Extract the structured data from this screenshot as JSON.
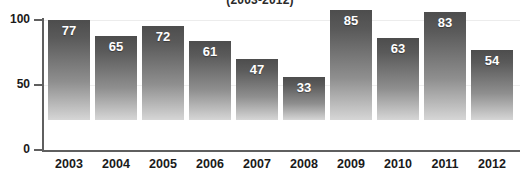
{
  "chart_data": {
    "type": "bar",
    "title": "(2003-2012)",
    "xlabel": "",
    "ylabel": "",
    "categories": [
      "2003",
      "2004",
      "2005",
      "2006",
      "2007",
      "2008",
      "2009",
      "2010",
      "2011",
      "2012"
    ],
    "values": [
      77,
      65,
      72,
      61,
      47,
      33,
      85,
      63,
      83,
      54
    ],
    "ylim": [
      0,
      100
    ],
    "ytick_labels": [
      "100",
      "50",
      "0"
    ],
    "ytick_values": [
      100,
      50,
      0
    ],
    "grid": true,
    "legend": null,
    "bar_color_top": "#4d4d4d",
    "bar_color_bottom": "#d6d6d6",
    "axis_color": "#5f5f5f",
    "label_color": "#ffffff",
    "tick_text_color": "#1a1a1a"
  }
}
